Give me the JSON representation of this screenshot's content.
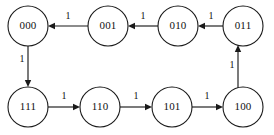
{
  "diagram": {
    "type": "directed-graph",
    "canvas": {
      "width": 274,
      "height": 135,
      "background": "#ffffff"
    },
    "style": {
      "stroke_color": "#1a1a1a",
      "node_fill": "#ffffff",
      "node_radius": 20
    },
    "nodes": [
      {
        "id": "n000",
        "label": "000",
        "cx": 28,
        "cy": 26,
        "r": 20
      },
      {
        "id": "n001",
        "label": "001",
        "cx": 108,
        "cy": 26,
        "r": 20
      },
      {
        "id": "n010",
        "label": "010",
        "cx": 178,
        "cy": 26,
        "r": 20
      },
      {
        "id": "n011",
        "label": "011",
        "cx": 243,
        "cy": 26,
        "r": 20
      },
      {
        "id": "n111",
        "label": "111",
        "cx": 28,
        "cy": 107,
        "r": 20
      },
      {
        "id": "n110",
        "label": "110",
        "cx": 100,
        "cy": 107,
        "r": 20
      },
      {
        "id": "n101",
        "label": "101",
        "cx": 172,
        "cy": 107,
        "r": 20
      },
      {
        "id": "n100",
        "label": "100",
        "cx": 243,
        "cy": 107,
        "r": 20
      }
    ],
    "edges": [
      {
        "id": "e011-010",
        "from": "011",
        "to": "010",
        "label": "1",
        "label_x": 211,
        "label_y": 17,
        "direction": "left"
      },
      {
        "id": "e010-001",
        "from": "010",
        "to": "001",
        "label": "1",
        "label_x": 143,
        "label_y": 17,
        "direction": "left"
      },
      {
        "id": "e001-000",
        "from": "001",
        "to": "000",
        "label": "1",
        "label_x": 68,
        "label_y": 17,
        "direction": "left"
      },
      {
        "id": "e000-111",
        "from": "000",
        "to": "111",
        "label": "1",
        "label_x": 22,
        "label_y": 66,
        "direction": "down"
      },
      {
        "id": "e111-110",
        "from": "111",
        "to": "110",
        "label": "1",
        "label_x": 64,
        "label_y": 97,
        "direction": "right"
      },
      {
        "id": "e110-101",
        "from": "110",
        "to": "101",
        "label": "1",
        "label_x": 136,
        "label_y": 97,
        "direction": "right"
      },
      {
        "id": "e101-100",
        "from": "101",
        "to": "100",
        "label": "1",
        "label_x": 207,
        "label_y": 97,
        "direction": "right"
      },
      {
        "id": "e100-011",
        "from": "100",
        "to": "011",
        "label": "1",
        "label_x": 232,
        "label_y": 66,
        "direction": "up"
      }
    ]
  }
}
